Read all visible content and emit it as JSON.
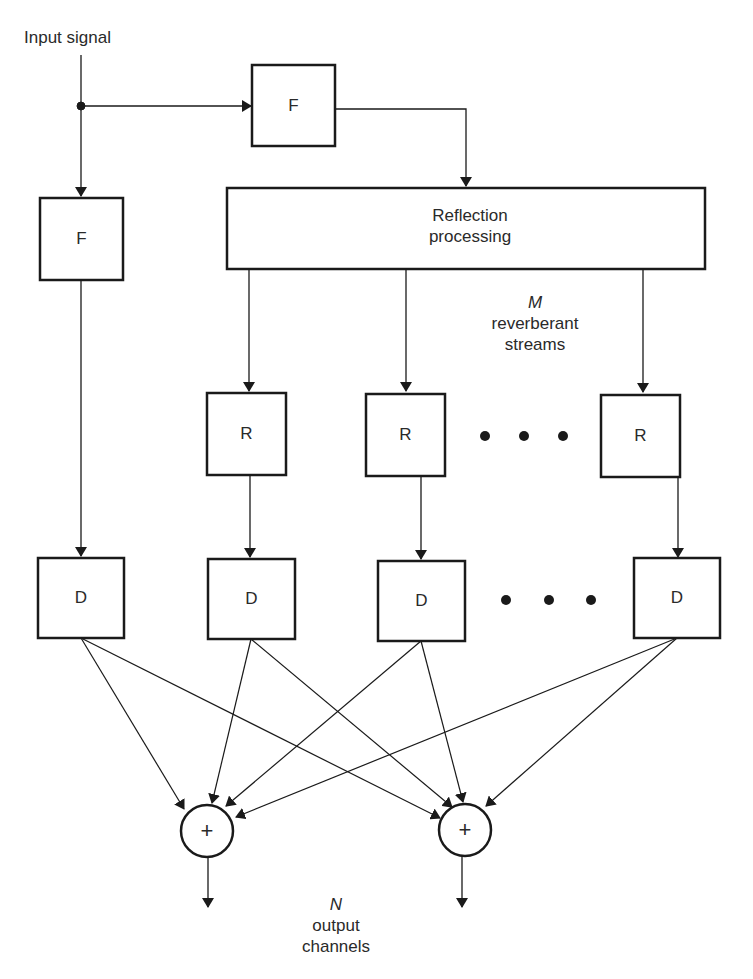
{
  "diagram": {
    "input_label": "Input signal",
    "filter_top": "F",
    "filter_left": "F",
    "reflection": {
      "line1": "Reflection",
      "line2": "processing"
    },
    "streams": {
      "symbol": "M",
      "line1": "reverberant",
      "line2": "streams"
    },
    "reverb_blocks": [
      "R",
      "R",
      "R"
    ],
    "delay_blocks": [
      "D",
      "D",
      "D",
      "D"
    ],
    "ellipsis": "• • •",
    "sum_symbol": "+",
    "outputs": {
      "symbol": "N",
      "line1": "output",
      "line2": "channels"
    },
    "colors": {
      "stroke": "#1a1a1a",
      "background": "#ffffff"
    }
  }
}
